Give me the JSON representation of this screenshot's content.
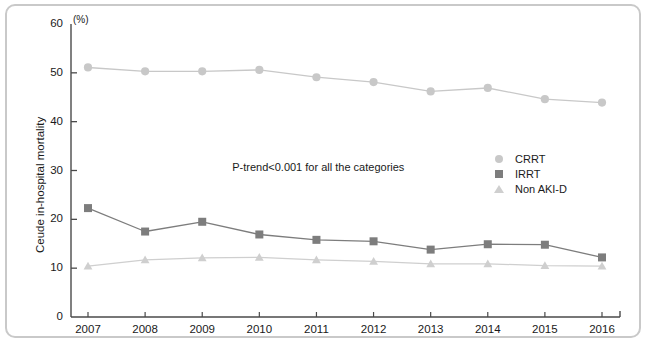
{
  "chart_data": {
    "type": "line",
    "title": "",
    "subtitle": "",
    "xlabel": "",
    "ylabel": "Ceude in-hospital mortality",
    "yunit": "(%)",
    "categories": [
      "2007",
      "2008",
      "2009",
      "2010",
      "2011",
      "2012",
      "2013",
      "2014",
      "2015",
      "2016"
    ],
    "x": [
      2007,
      2008,
      2009,
      2010,
      2011,
      2012,
      2013,
      2014,
      2015,
      2016
    ],
    "xlim": [
      2006.6,
      2016.4
    ],
    "ylim": [
      0,
      60
    ],
    "yticks": [
      0,
      10,
      20,
      30,
      40,
      50,
      60
    ],
    "xticks": [
      2007,
      2008,
      2009,
      2010,
      2011,
      2012,
      2013,
      2014,
      2015,
      2016
    ],
    "grid": false,
    "legend_position": "center-right",
    "series": [
      {
        "name": "CRRT",
        "marker": "circle",
        "color": "#c8c8c8",
        "values": [
          51.1,
          50.3,
          50.3,
          50.6,
          49.1,
          48.1,
          46.2,
          46.9,
          44.6,
          43.9
        ]
      },
      {
        "name": "IRRT",
        "marker": "square",
        "color": "#7d7d7d",
        "values": [
          22.3,
          17.5,
          19.5,
          16.9,
          15.8,
          15.5,
          13.8,
          14.9,
          14.8,
          12.2
        ]
      },
      {
        "name": "Non AKI-D",
        "marker": "triangle",
        "color": "#cfcfcf",
        "values": [
          10.4,
          11.7,
          12.1,
          12.2,
          11.7,
          11.4,
          10.9,
          10.9,
          10.5,
          10.4
        ]
      }
    ],
    "annotations": [
      {
        "text": "P-trend<0.001 for all the categories",
        "x": 2009.3,
        "y": 30.6
      }
    ]
  },
  "legend": {
    "items": [
      {
        "label": "CRRT"
      },
      {
        "label": "IRRT"
      },
      {
        "label": "Non AKI-D"
      }
    ]
  }
}
